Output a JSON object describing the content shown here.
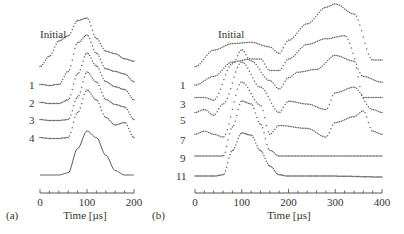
{
  "chart_data": [
    {
      "panel": "(a)",
      "type": "line",
      "style": "waterfall / offset traces",
      "xlabel": "Time [µs]",
      "ylabel": "",
      "xlim": [
        0,
        200
      ],
      "xticks": [
        0,
        100,
        200
      ],
      "minor_tick_step": 20,
      "grid": false,
      "legend": "none (trace labels at left)",
      "trace_labels": [
        "Initial",
        "1",
        "2",
        "3",
        "4",
        ""
      ],
      "series": [
        {
          "name": "Initial",
          "marker": "dots",
          "x": [
            0,
            20,
            40,
            60,
            80,
            100,
            120,
            140,
            160,
            180,
            200
          ],
          "y": [
            0.05,
            0.25,
            0.55,
            0.65,
            0.95,
            1.0,
            0.6,
            0.35,
            0.3,
            0.2,
            0.15
          ]
        },
        {
          "name": "1",
          "marker": "dots",
          "x": [
            0,
            20,
            40,
            60,
            80,
            100,
            120,
            140,
            160,
            180,
            200
          ],
          "y": [
            0.05,
            0.03,
            0.05,
            0.3,
            0.85,
            1.0,
            0.65,
            0.35,
            0.3,
            0.25,
            0.1
          ]
        },
        {
          "name": "2",
          "marker": "dots",
          "x": [
            0,
            20,
            40,
            60,
            80,
            100,
            120,
            140,
            160,
            180,
            200
          ],
          "y": [
            0.05,
            0.03,
            0.03,
            0.1,
            0.6,
            1.0,
            0.75,
            0.45,
            0.35,
            0.3,
            0.1
          ]
        },
        {
          "name": "3",
          "marker": "dots",
          "x": [
            0,
            20,
            40,
            60,
            80,
            100,
            120,
            140,
            160,
            180,
            200
          ],
          "y": [
            0.05,
            0.03,
            0.03,
            0.05,
            0.5,
            1.0,
            0.8,
            0.45,
            0.35,
            0.3,
            0.05
          ]
        },
        {
          "name": "4",
          "marker": "dots",
          "x": [
            0,
            20,
            40,
            60,
            80,
            100,
            120,
            140,
            160,
            180,
            200
          ],
          "y": [
            0.05,
            0.03,
            0.03,
            0.05,
            0.55,
            1.0,
            0.8,
            0.45,
            0.3,
            0.35,
            0.05
          ]
        },
        {
          "name": "reference",
          "marker": "solid line",
          "x": [
            0,
            20,
            40,
            60,
            80,
            100,
            120,
            140,
            160,
            180,
            200
          ],
          "y": [
            0,
            0,
            0,
            0.05,
            0.6,
            1.0,
            0.85,
            0.45,
            0.1,
            0,
            0
          ]
        }
      ]
    },
    {
      "panel": "(b)",
      "type": "line",
      "style": "waterfall / offset traces",
      "xlabel": "Time [µs]",
      "ylabel": "",
      "xlim": [
        0,
        400
      ],
      "xticks": [
        0,
        100,
        200,
        300,
        400
      ],
      "minor_tick_step": 20,
      "grid": false,
      "legend": "none (trace labels at left)",
      "trace_labels": [
        "Initial",
        "1",
        "3",
        "5",
        "7",
        "9",
        "11"
      ],
      "series": [
        {
          "name": "Initial",
          "marker": "dots",
          "x": [
            0,
            40,
            80,
            120,
            160,
            180,
            200,
            240,
            280,
            300,
            340,
            380,
            400
          ],
          "y": [
            0.05,
            0.3,
            0.4,
            0.42,
            0.35,
            0.25,
            0.45,
            0.7,
            0.95,
            1.0,
            0.85,
            0.15,
            0.15
          ]
        },
        {
          "name": "1",
          "marker": "dots",
          "x": [
            0,
            40,
            80,
            120,
            140,
            160,
            180,
            200,
            240,
            280,
            320,
            360,
            400
          ],
          "y": [
            0.05,
            0.2,
            0.45,
            0.5,
            0.5,
            0.3,
            0.3,
            0.5,
            0.75,
            0.85,
            0.9,
            0.2,
            0.1
          ]
        },
        {
          "name": "3",
          "marker": "dots",
          "x": [
            0,
            20,
            40,
            80,
            100,
            120,
            160,
            180,
            200,
            220,
            260,
            300,
            340,
            360,
            400
          ],
          "y": [
            0.1,
            0.1,
            0.05,
            0.7,
            0.95,
            0.75,
            0.4,
            0.25,
            0.45,
            0.55,
            0.6,
            0.85,
            0.75,
            0.1,
            0.1
          ]
        },
        {
          "name": "5",
          "marker": "dots",
          "x": [
            0,
            20,
            40,
            60,
            100,
            140,
            180,
            200,
            240,
            280,
            300,
            340,
            380,
            400
          ],
          "y": [
            0.1,
            0.15,
            0.05,
            0.25,
            1.0,
            0.55,
            0.1,
            0.3,
            0.25,
            0.15,
            0.45,
            0.55,
            0.15,
            0.1
          ]
        },
        {
          "name": "7",
          "marker": "dots",
          "x": [
            0,
            20,
            40,
            60,
            100,
            140,
            160,
            180,
            240,
            280,
            300,
            340,
            360,
            380,
            400
          ],
          "y": [
            0.1,
            0.15,
            0.1,
            0.05,
            1.0,
            0.6,
            0.1,
            0.25,
            0.2,
            0.05,
            0.3,
            0.4,
            0.5,
            0.15,
            0.1
          ]
        },
        {
          "name": "9",
          "marker": "dots",
          "x": [
            0,
            40,
            60,
            80,
            100,
            120,
            140,
            160,
            180,
            200,
            300,
            400
          ],
          "y": [
            0.05,
            0.05,
            0.05,
            0.55,
            1.0,
            0.95,
            0.6,
            0.15,
            0.05,
            0.05,
            0.05,
            0.05
          ]
        },
        {
          "name": "11",
          "marker": "dots (dense)",
          "x": [
            0,
            40,
            60,
            80,
            100,
            120,
            140,
            160,
            180,
            200,
            300,
            400
          ],
          "y": [
            0.02,
            0.02,
            0.05,
            0.6,
            1.0,
            0.95,
            0.6,
            0.25,
            0.05,
            0.02,
            0.02,
            0.0
          ]
        }
      ]
    }
  ],
  "panels": {
    "a": {
      "label": "(a)",
      "xlabel": "Time [µs]",
      "tick_labels": [
        "0",
        "100",
        "200"
      ],
      "trace_labels": [
        "Initial",
        "1",
        "2",
        "3",
        "4"
      ]
    },
    "b": {
      "label": "(b)",
      "xlabel": "Time [µs]",
      "tick_labels": [
        "0",
        "100",
        "200",
        "300",
        "400"
      ],
      "trace_labels": [
        "Initial",
        "1",
        "3",
        "5",
        "7",
        "9",
        "11"
      ]
    }
  },
  "colors": {
    "trace": "#666666",
    "axis": "#444444",
    "text": "#333333"
  }
}
